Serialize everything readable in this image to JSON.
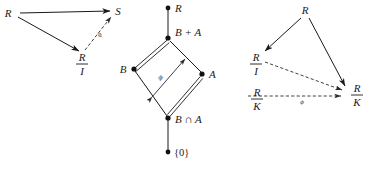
{
  "figure": {
    "background_color": "#ffffff",
    "ink_color": "#1a1a1a",
    "width": 380,
    "height": 176
  },
  "panel_left": {
    "name": "homomorphism-triangle",
    "nodes": [
      {
        "id": "R",
        "label": "R",
        "x": 12,
        "y": 14
      },
      {
        "id": "S",
        "label": "S",
        "x": 115,
        "y": 12
      },
      {
        "id": "RI",
        "label_num": "R",
        "label_den": "I",
        "x": 82,
        "y": 58
      }
    ],
    "edges": [
      {
        "from": "R",
        "to": "S",
        "style": "solid",
        "arrow": "end",
        "label": ""
      },
      {
        "from": "R",
        "to": "RI",
        "style": "solid",
        "arrow": "end",
        "label": ""
      },
      {
        "from": "RI",
        "to": "S",
        "style": "dashed",
        "arrow": "end",
        "label": "ϕ"
      }
    ],
    "edge_label": "ϕ"
  },
  "panel_middle": {
    "name": "modular-lattice-diamond",
    "nodes": [
      {
        "id": "R",
        "label": "R",
        "x": 168,
        "y": 8,
        "label_dx": 6,
        "label_dy": 4
      },
      {
        "id": "BA",
        "label": "B + A",
        "x": 168,
        "y": 38,
        "label_dx": 6,
        "label_dy": -3
      },
      {
        "id": "B",
        "label": "B",
        "x": 134,
        "y": 68,
        "label_dx": -12,
        "label_dy": 4
      },
      {
        "id": "A",
        "label": "A",
        "x": 202,
        "y": 75,
        "label_dx": 6,
        "label_dy": 4
      },
      {
        "id": "BnA",
        "label": "B ∩ A",
        "x": 168,
        "y": 118,
        "label_dx": 6,
        "label_dy": 4
      },
      {
        "id": "ZERO",
        "label": "{0}",
        "x": 168,
        "y": 152,
        "label_dx": 6,
        "label_dy": 4
      }
    ],
    "edges": [
      {
        "from": "R",
        "to": "BA",
        "style": "single"
      },
      {
        "from": "BA",
        "to": "B",
        "style": "double"
      },
      {
        "from": "BA",
        "to": "A",
        "style": "single"
      },
      {
        "from": "B",
        "to": "BnA",
        "style": "single"
      },
      {
        "from": "A",
        "to": "BnA",
        "style": "double"
      },
      {
        "from": "BnA",
        "to": "ZERO",
        "style": "single"
      }
    ],
    "inner_arrow": {
      "label": "≅",
      "from_x": 152,
      "from_y": 96,
      "to_x": 186,
      "to_y": 58
    }
  },
  "panel_right": {
    "name": "quotient-map-triangle",
    "nodes": [
      {
        "id": "R",
        "label": "R",
        "x": 305,
        "y": 12
      },
      {
        "id": "RI",
        "label_num": "R",
        "label_den": "I",
        "x": 254,
        "y": 62
      },
      {
        "id": "RK",
        "label_num": "R",
        "label_den": "K",
        "x": 352,
        "y": 96
      },
      {
        "id": "RK2",
        "label_num": "R",
        "label_den": "K",
        "x": 258,
        "y": 100
      }
    ],
    "edges": [
      {
        "from": "R",
        "to": "RI",
        "style": "solid",
        "arrow": "end"
      },
      {
        "from": "R",
        "to": "RK",
        "style": "solid",
        "arrow": "end"
      },
      {
        "from": "RI",
        "to": "RK",
        "style": "dashed",
        "arrow": "end"
      },
      {
        "from": "RK2",
        "to": "RK",
        "style": "dashed",
        "arrow": "end",
        "label": "ϕ"
      }
    ],
    "edge_label": "ϕ"
  }
}
